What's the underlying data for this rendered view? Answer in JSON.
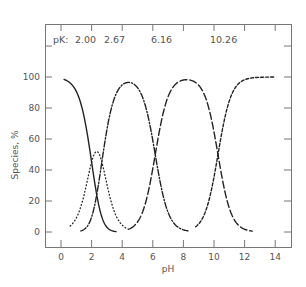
{
  "chart_data": {
    "type": "line",
    "title": "",
    "xlabel": "pH",
    "ylabel": "Species, %",
    "xlim": [
      -1,
      15
    ],
    "ylim": [
      -10,
      134
    ],
    "xticks": [
      0,
      2,
      4,
      6,
      8,
      10,
      12,
      14
    ],
    "yticks": [
      0,
      20,
      40,
      60,
      80,
      100
    ],
    "grid": false,
    "legend": "none",
    "annotations": {
      "pk_prefix": "pK:",
      "pk_values": [
        "2.00",
        "2.67",
        "6.16",
        "10.26"
      ]
    },
    "pKa": [
      2.0,
      2.67,
      6.16,
      10.26
    ],
    "series": [
      {
        "name": "H4A",
        "style": "solid",
        "x_range": [
          0.2,
          3.6
        ],
        "x": [
          0.2,
          0.5,
          1.0,
          1.5,
          2.0,
          2.3,
          2.5,
          3.0,
          3.6
        ],
        "values": [
          99,
          97,
          90,
          75,
          50,
          33,
          24,
          10,
          2
        ]
      },
      {
        "name": "H3A",
        "style": "dotted",
        "x_range": [
          0.6,
          4.5
        ],
        "x": [
          0.6,
          1.0,
          1.5,
          2.0,
          2.3,
          2.5,
          3.0,
          3.5,
          4.0,
          4.5
        ],
        "values": [
          4,
          9,
          22,
          39,
          44,
          43,
          33,
          14,
          5,
          2
        ]
      },
      {
        "name": "H2A",
        "style": "dashdot",
        "x_range": [
          1.3,
          8.3
        ],
        "x": [
          1.3,
          2.0,
          2.5,
          3.0,
          3.5,
          4.0,
          4.4,
          5.0,
          6.0,
          6.16,
          7.0,
          8.0,
          8.3
        ],
        "values": [
          1,
          11,
          26,
          57,
          84,
          95,
          98,
          93,
          59,
          50,
          12,
          1,
          1
        ]
      },
      {
        "name": "HA",
        "style": "longdash",
        "x_range": [
          4.5,
          12.5
        ],
        "x": [
          4.5,
          5.0,
          6.16,
          7.0,
          8.2,
          9.0,
          10.26,
          11.0,
          12.0,
          12.5
        ],
        "values": [
          2,
          7,
          50,
          87,
          99,
          95,
          50,
          15,
          2,
          1
        ]
      },
      {
        "name": "A",
        "style": "shortdash",
        "x_range": [
          8.8,
          14.0
        ],
        "x": [
          8.8,
          9.5,
          10.26,
          11.0,
          12.0,
          13.0,
          14.0
        ],
        "values": [
          3,
          15,
          50,
          85,
          98,
          99.8,
          100
        ]
      }
    ]
  }
}
